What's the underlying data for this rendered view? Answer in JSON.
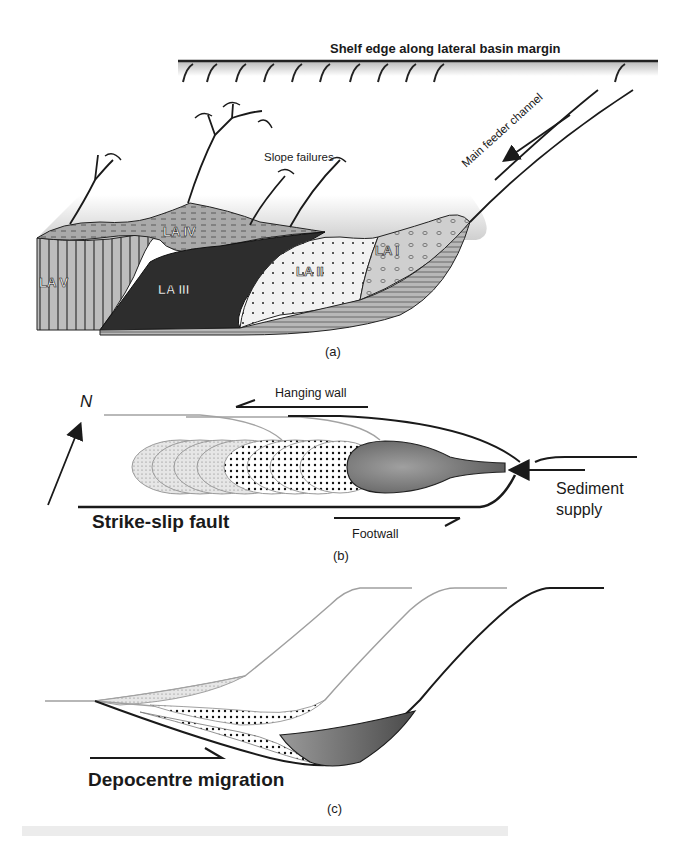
{
  "figure": {
    "panels": [
      {
        "id": "a",
        "caption": "(a)",
        "labels": {
          "shelf_edge": "Shelf edge along lateral basin margin",
          "slope_failures": "Slope failures",
          "main_feeder_channel": "Main feeder channel",
          "la_i": "LA I",
          "la_ii": "LA II",
          "la_iii": "LA III",
          "la_iv": "LA IV",
          "la_v": "LA V"
        }
      },
      {
        "id": "b",
        "caption": "(b)",
        "labels": {
          "north": "N",
          "hanging_wall": "Hanging wall",
          "footwall": "Footwall",
          "strike_slip_fault": "Strike-slip fault",
          "sediment_supply_line1": "Sediment",
          "sediment_supply_line2": "supply"
        }
      },
      {
        "id": "c",
        "caption": "(c)",
        "labels": {
          "depocentre_migration": "Depocentre migration"
        }
      }
    ]
  },
  "colors": {
    "ink": "#1a1a1a",
    "dark_fill": "#3a3a3a",
    "mid_fill": "#8a8a8a",
    "light_fill": "#d6d6d6",
    "gray_line": "#9a9a9a",
    "background": "#ffffff"
  }
}
